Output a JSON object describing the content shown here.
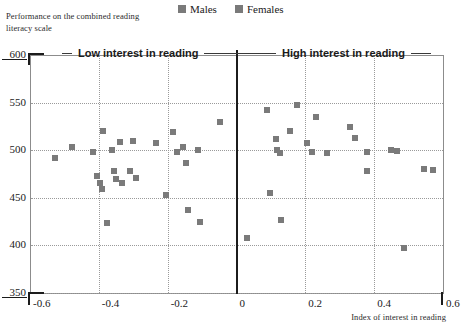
{
  "figure": {
    "note": "Performance on the combined reading literacy scale",
    "xaxis_title": "Index of interest in reading",
    "left_section_label": "Low interest in reading",
    "right_section_label": "High interest in reading",
    "marker_color": "#7a7a7a",
    "axis_color": "#8c8c8c",
    "divider_color": "#1c1c1c"
  },
  "legend": {
    "items": [
      {
        "label": "Males",
        "color": "#7a7a7a",
        "swatch": "square-swatch"
      },
      {
        "label": "Females",
        "color": "#7a7a7a",
        "swatch": "square-swatch"
      }
    ]
  },
  "chart_data": {
    "type": "scatter",
    "title": "Performance on the combined reading literacy scale",
    "xlabel": "Index of interest in reading",
    "ylabel": "Performance on the combined reading literacy scale",
    "xlim": [
      -0.6,
      0.6
    ],
    "ylim": [
      350,
      600
    ],
    "xticks": [
      -0.6,
      -0.4,
      -0.2,
      0,
      0.2,
      0.4,
      0.6
    ],
    "xtick_labels": [
      "-0.6",
      "-0.4",
      "-0.2",
      "0",
      "0.2",
      "0.4",
      "0.6"
    ],
    "yticks": [
      350,
      400,
      450,
      500,
      550,
      600
    ],
    "ytick_labels": [
      "350",
      "400",
      "450",
      "500",
      "550",
      "600"
    ],
    "grid": true,
    "legend_position": "top-center",
    "annotations": [
      {
        "text": "Low interest in reading",
        "x": -0.3,
        "y": 600
      },
      {
        "text": "High interest in reading",
        "x": 0.3,
        "y": 600
      }
    ],
    "series": [
      {
        "name": "Males",
        "color": "#7a7a7a",
        "points": [
          [
            -0.527,
            492
          ],
          [
            -0.477,
            503
          ],
          [
            -0.418,
            498
          ],
          [
            -0.404,
            473
          ],
          [
            -0.398,
            466
          ],
          [
            -0.392,
            459
          ],
          [
            -0.389,
            520
          ],
          [
            -0.377,
            424
          ],
          [
            -0.362,
            500
          ],
          [
            -0.356,
            478
          ],
          [
            -0.35,
            470
          ],
          [
            -0.338,
            509
          ],
          [
            -0.332,
            466
          ],
          [
            -0.31,
            478
          ],
          [
            -0.3,
            510
          ],
          [
            -0.292,
            471
          ],
          [
            -0.235,
            508
          ],
          [
            -0.205,
            453
          ],
          [
            -0.185,
            519
          ],
          [
            -0.172,
            498
          ],
          [
            -0.155,
            503
          ],
          [
            -0.148,
            487
          ],
          [
            -0.14,
            437
          ],
          [
            -0.112,
            500
          ],
          [
            -0.105,
            425
          ],
          [
            -0.048,
            530
          ],
          [
            0.03,
            408
          ],
          [
            0.09,
            542
          ],
          [
            0.098,
            455
          ],
          [
            0.115,
            512
          ],
          [
            0.118,
            500
          ],
          [
            0.125,
            497
          ],
          [
            0.13,
            427
          ],
          [
            0.155,
            520
          ],
          [
            0.175,
            548
          ],
          [
            0.205,
            508
          ],
          [
            0.218,
            498
          ],
          [
            0.23,
            535
          ],
          [
            0.262,
            497
          ],
          [
            0.33,
            524
          ],
          [
            0.345,
            513
          ],
          [
            0.378,
            498
          ],
          [
            0.38,
            478
          ],
          [
            0.45,
            500
          ],
          [
            0.465,
            499
          ],
          [
            0.488,
            397
          ],
          [
            0.545,
            480
          ],
          [
            0.57,
            479
          ]
        ]
      }
    ]
  },
  "axes": {
    "y_labels": [
      "600",
      "550",
      "500",
      "450",
      "400",
      "350"
    ],
    "x_labels": [
      "-0.6",
      "-0.4",
      "-0.2",
      "0",
      "0.2",
      "0.4",
      "0.6"
    ]
  }
}
